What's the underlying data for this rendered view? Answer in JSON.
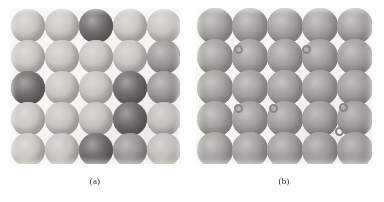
{
  "figure": {
    "background_color": "#ffffff",
    "panel_background_color": "#f7f6f3",
    "width": 384,
    "height": 202
  },
  "panels": [
    {
      "id": "panel-a",
      "caption": "(a)",
      "description": "Five-by-five array of close-packed spheres with several darker-shaded substitutional spheres",
      "x": 10,
      "y": 8,
      "width": 170,
      "height": 156,
      "grid": {
        "rows": 5,
        "cols": 5
      },
      "sphere_diameter": 34,
      "col_step": 34,
      "row_step": 31,
      "col_origin": 18,
      "row_origin": 18,
      "light_color": "#c9c7c2",
      "mid_color": "#9e9c98",
      "dark_color": "#6f6d6a",
      "spheres": [
        {
          "row": 1,
          "col": 1,
          "shade": "light"
        },
        {
          "row": 1,
          "col": 2,
          "shade": "light"
        },
        {
          "row": 1,
          "col": 3,
          "shade": "dark"
        },
        {
          "row": 1,
          "col": 4,
          "shade": "light"
        },
        {
          "row": 1,
          "col": 5,
          "shade": "light"
        },
        {
          "row": 2,
          "col": 1,
          "shade": "light"
        },
        {
          "row": 2,
          "col": 2,
          "shade": "light"
        },
        {
          "row": 2,
          "col": 3,
          "shade": "light"
        },
        {
          "row": 2,
          "col": 4,
          "shade": "light"
        },
        {
          "row": 2,
          "col": 5,
          "shade": "medium"
        },
        {
          "row": 3,
          "col": 1,
          "shade": "dark"
        },
        {
          "row": 3,
          "col": 2,
          "shade": "light"
        },
        {
          "row": 3,
          "col": 3,
          "shade": "light"
        },
        {
          "row": 3,
          "col": 4,
          "shade": "dark"
        },
        {
          "row": 3,
          "col": 5,
          "shade": "medium"
        },
        {
          "row": 4,
          "col": 1,
          "shade": "light"
        },
        {
          "row": 4,
          "col": 2,
          "shade": "light"
        },
        {
          "row": 4,
          "col": 3,
          "shade": "light"
        },
        {
          "row": 4,
          "col": 4,
          "shade": "dark"
        },
        {
          "row": 4,
          "col": 5,
          "shade": "light"
        },
        {
          "row": 5,
          "col": 1,
          "shade": "light"
        },
        {
          "row": 5,
          "col": 2,
          "shade": "light"
        },
        {
          "row": 5,
          "col": 3,
          "shade": "dark"
        },
        {
          "row": 5,
          "col": 4,
          "shade": "medium"
        },
        {
          "row": 5,
          "col": 5,
          "shade": "light"
        }
      ],
      "interstitials": []
    },
    {
      "id": "panel-b",
      "caption": "(b)",
      "description": "Five-by-five array of uniformly shaded spheres with six small interstitial rings in the gaps",
      "x": 196,
      "y": 8,
      "width": 176,
      "height": 156,
      "grid": {
        "rows": 5,
        "cols": 5
      },
      "sphere_diameter": 36,
      "col_step": 35,
      "row_step": 31,
      "col_origin": 19,
      "row_origin": 18,
      "light_color": "#bab8b4",
      "mid_color": "#a3a19d",
      "dark_color": "#8b8985",
      "spheres": [
        {
          "row": 1,
          "col": 1,
          "shade": "medium"
        },
        {
          "row": 1,
          "col": 2,
          "shade": "medium"
        },
        {
          "row": 1,
          "col": 3,
          "shade": "medium"
        },
        {
          "row": 1,
          "col": 4,
          "shade": "medium"
        },
        {
          "row": 1,
          "col": 5,
          "shade": "medium"
        },
        {
          "row": 2,
          "col": 1,
          "shade": "medium"
        },
        {
          "row": 2,
          "col": 2,
          "shade": "medium"
        },
        {
          "row": 2,
          "col": 3,
          "shade": "medium"
        },
        {
          "row": 2,
          "col": 4,
          "shade": "medium"
        },
        {
          "row": 2,
          "col": 5,
          "shade": "medium"
        },
        {
          "row": 3,
          "col": 1,
          "shade": "medium"
        },
        {
          "row": 3,
          "col": 2,
          "shade": "medium"
        },
        {
          "row": 3,
          "col": 3,
          "shade": "medium"
        },
        {
          "row": 3,
          "col": 4,
          "shade": "medium"
        },
        {
          "row": 3,
          "col": 5,
          "shade": "medium"
        },
        {
          "row": 4,
          "col": 1,
          "shade": "medium"
        },
        {
          "row": 4,
          "col": 2,
          "shade": "medium"
        },
        {
          "row": 4,
          "col": 3,
          "shade": "medium"
        },
        {
          "row": 4,
          "col": 4,
          "shade": "medium"
        },
        {
          "row": 4,
          "col": 5,
          "shade": "medium"
        },
        {
          "row": 5,
          "col": 1,
          "shade": "medium"
        },
        {
          "row": 5,
          "col": 2,
          "shade": "medium"
        },
        {
          "row": 5,
          "col": 3,
          "shade": "medium"
        },
        {
          "row": 5,
          "col": 4,
          "shade": "medium"
        },
        {
          "row": 5,
          "col": 5,
          "shade": "medium"
        }
      ],
      "interstitial_diameter": 9,
      "interstitial_ring_color": "#8a8884",
      "interstitials": [
        {
          "cx": 42,
          "cy": 41
        },
        {
          "cx": 110,
          "cy": 41
        },
        {
          "cx": 42,
          "cy": 100
        },
        {
          "cx": 77,
          "cy": 100
        },
        {
          "cx": 147,
          "cy": 99
        },
        {
          "cx": 143,
          "cy": 123
        }
      ]
    }
  ],
  "captions": [
    {
      "label": "(a)",
      "center_x": 95,
      "y": 176
    },
    {
      "label": "(b)",
      "center_x": 284,
      "y": 176
    }
  ]
}
